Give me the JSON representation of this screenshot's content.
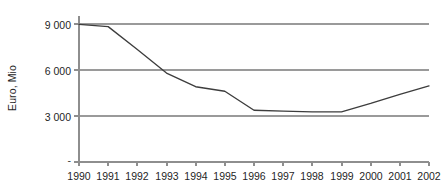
{
  "chart_data": {
    "type": "line",
    "title": "",
    "subtitle": "",
    "xlabel": "",
    "ylabel": "Euro, Mio",
    "categories": [
      "1990",
      "1991",
      "1992",
      "1993",
      "1994",
      "1995",
      "1996",
      "1997",
      "1998",
      "1999",
      "2000",
      "2001",
      "2002"
    ],
    "series": [
      {
        "name": "",
        "values": [
          9050,
          8900,
          7400,
          5850,
          4950,
          4650,
          3400,
          3350,
          3300,
          3300,
          3850,
          4450,
          5000
        ]
      }
    ],
    "ylim": [
      0,
      9600
    ],
    "ytick_values": [
      0,
      3000,
      6000,
      9000
    ],
    "ytick_labels": [
      "-",
      "3 000",
      "6 000",
      "9 000"
    ],
    "grid": "horizontal",
    "gridlines_at": [
      3000,
      6000,
      9000
    ],
    "legend": "none",
    "annotations": [],
    "line_color": "#3d3d3d",
    "grid_color": "#9a9a9a",
    "axis_color": "#8e8e8e",
    "background_color": "#ffffff"
  },
  "axes": {
    "y_title": "Euro, Mio",
    "x_title": "",
    "y_ticks": [
      {
        "label": "9 000",
        "value": 9000
      },
      {
        "label": "6 000",
        "value": 6000
      },
      {
        "label": "3 000",
        "value": 3000
      },
      {
        "label": "-",
        "value": 0
      }
    ],
    "x_ticks": [
      {
        "label": "1990"
      },
      {
        "label": "1991"
      },
      {
        "label": "1992"
      },
      {
        "label": "1993"
      },
      {
        "label": "1994"
      },
      {
        "label": "1995"
      },
      {
        "label": "1996"
      },
      {
        "label": "1997"
      },
      {
        "label": "1998"
      },
      {
        "label": "1999"
      },
      {
        "label": "2000"
      },
      {
        "label": "2001"
      },
      {
        "label": "2002"
      }
    ]
  },
  "geometry": {
    "plot_left": 79,
    "plot_right": 429,
    "plot_top": 16,
    "plot_bottom": 162,
    "value_top": 9600,
    "value_bottom": 0
  }
}
